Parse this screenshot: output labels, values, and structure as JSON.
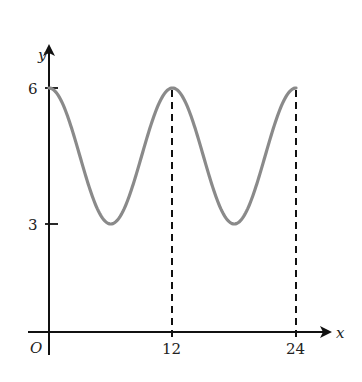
{
  "chart_data": {
    "type": "line",
    "title": "",
    "xlabel": "x",
    "ylabel": "y",
    "origin_label": "O",
    "function": "y = 4.5 + 1.5cos(πx/6)",
    "x_ticks": [
      12,
      24
    ],
    "y_ticks": [
      3,
      6
    ],
    "xlim": [
      0,
      24
    ],
    "ylim": [
      0,
      6
    ],
    "period": 12,
    "max": 6,
    "min": 3,
    "series": [
      {
        "name": "curve",
        "color": "#8a8a8a",
        "x": [
          0,
          3,
          6,
          9,
          12,
          15,
          18,
          21,
          24
        ],
        "values": [
          6,
          4.5,
          3,
          4.5,
          6,
          4.5,
          3,
          4.5,
          6
        ]
      }
    ],
    "dashed_guides": [
      12,
      24
    ],
    "grid": false,
    "legend": null
  },
  "colors": {
    "axis": "#111111",
    "curve": "#8a8a8a"
  }
}
